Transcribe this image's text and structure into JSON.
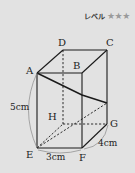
{
  "header": {
    "level_label": "レベル",
    "stars": "★★★",
    "star_count": 3
  },
  "figure": {
    "type": "rectangular-prism",
    "vertices": {
      "A": "A",
      "B": "B",
      "C": "C",
      "D": "D",
      "E": "E",
      "F": "F",
      "G": "G",
      "H": "H"
    },
    "dimensions": {
      "height": "5cm",
      "width": "3cm",
      "depth": "4cm"
    }
  },
  "colors": {
    "background": "#e2e2e2",
    "line": "#1a1a1a",
    "arc": "#888888",
    "star": "#9a9a9a"
  }
}
